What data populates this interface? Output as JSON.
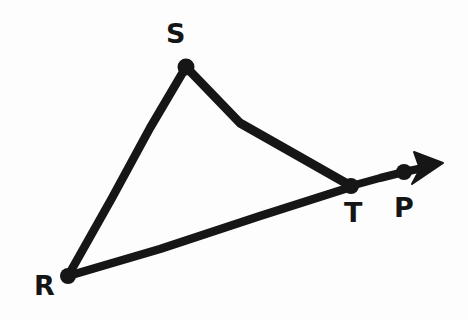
{
  "figure": {
    "background_color": "#fdfdfd",
    "ink_color": "#161616",
    "canvas": {
      "width": 468,
      "height": 320
    },
    "stroke_width": 8.5,
    "points": [
      {
        "id": "R",
        "label": "R",
        "x": 68,
        "y": 276,
        "label_x": 34,
        "label_y": 274,
        "dot_radius": 7.5
      },
      {
        "id": "S",
        "label": "S",
        "x": 186,
        "y": 66,
        "label_x": 165,
        "label_y": 20,
        "dot_radius": 7.5
      },
      {
        "id": "T",
        "label": "T",
        "x": 351,
        "y": 186,
        "label_x": 343,
        "label_y": 200,
        "dot_radius": 7.0
      },
      {
        "id": "P",
        "label": "P",
        "x": 404,
        "y": 172,
        "label_x": 393,
        "label_y": 194,
        "dot_radius": 7.0
      }
    ],
    "segments": [
      {
        "id": "RS",
        "from": "R",
        "to": "S",
        "label": "segment R to S"
      },
      {
        "id": "ST",
        "from": "S",
        "to": "T",
        "label": "segment S to T"
      },
      {
        "id": "RT",
        "from": "R",
        "to": "T",
        "label": "segment R to T"
      },
      {
        "id": "TP",
        "from": "T",
        "to": "P",
        "label": "segment T to P"
      }
    ],
    "ray": {
      "id": "ray-RP",
      "label": "ray from R through T and P",
      "arrow_tip_x": 442,
      "arrow_tip_y": 163,
      "arrow_base_x": 412,
      "arrow_base_y": 170
    },
    "path_data": {
      "rs": "M 68 276 L 112 198 L 150 128 L 186 67",
      "st": "M 186 67 L 240 123 L 300 157 L 351 186",
      "rt": "M 68 276 L 160 249 L 260 216 L 351 187",
      "tp": "M 351 186 L 380 178 L 404 172 L 418 169",
      "arrow": "M 443 163 L 414 152 L 420 169 L 412 184 Z"
    }
  }
}
